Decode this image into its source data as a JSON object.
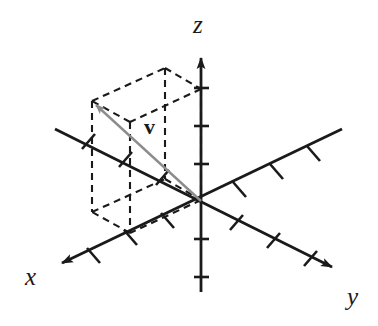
{
  "figure": {
    "background_color": "#ffffff",
    "axis_color": "#1a1a1a",
    "vector_color": "#8c8c8c",
    "dash_color": "#1a1a1a",
    "canvas": {
      "width": 378,
      "height": 326
    },
    "origin": {
      "x": 201,
      "y": 201
    }
  },
  "labels": {
    "x_axis": "x",
    "y_axis": "y",
    "z_axis": "z",
    "vector": "v"
  },
  "axes": [
    {
      "name": "x-axis",
      "label": "x",
      "arrow_at": "negative-screen-lower-left",
      "positive_end": {
        "x": 53,
        "y": 268
      },
      "negative_end": {
        "x": 342,
        "y": 129
      },
      "tick_count_positive": 4,
      "tick_count_negative": 3,
      "tick_spacing_px": 37
    },
    {
      "name": "y-axis",
      "label": "y",
      "arrow_at": "screen-lower-right",
      "positive_end": {
        "x": 341,
        "y": 272
      },
      "negative_end": {
        "x": 55,
        "y": 129
      },
      "tick_count_positive": 3,
      "tick_count_negative": 3,
      "tick_spacing_px": 44
    },
    {
      "name": "z-axis",
      "label": "z",
      "arrow_at": "screen-top",
      "positive_end": {
        "x": 201,
        "y": 48
      },
      "negative_end": {
        "x": 201,
        "y": 292
      },
      "tick_count_positive": 3,
      "tick_count_negative": 3,
      "tick_spacing_px": 38
    }
  ],
  "vector": {
    "name": "v",
    "tail": {
      "x": 201,
      "y": 201
    },
    "head": {
      "x": 92,
      "y": 101
    },
    "color": "#8c8c8c",
    "has_arrowhead": true,
    "label_position": {
      "x": 152,
      "y": 130
    }
  },
  "dashed_box": {
    "style": "dashed",
    "describes": "rectangular parallelepiped showing the components of v",
    "vertices": {
      "v_tip_top_left": {
        "x": 92,
        "y": 101
      },
      "top_back": {
        "x": 165,
        "y": 68
      },
      "top_right_on_z": {
        "x": 201,
        "y": 89
      },
      "top_front": {
        "x": 130,
        "y": 122
      },
      "bottom_left": {
        "x": 92,
        "y": 212
      },
      "bottom_back": {
        "x": 165,
        "y": 179
      },
      "bottom_right": {
        "x": 201,
        "y": 200
      },
      "bottom_front": {
        "x": 130,
        "y": 233
      }
    }
  }
}
